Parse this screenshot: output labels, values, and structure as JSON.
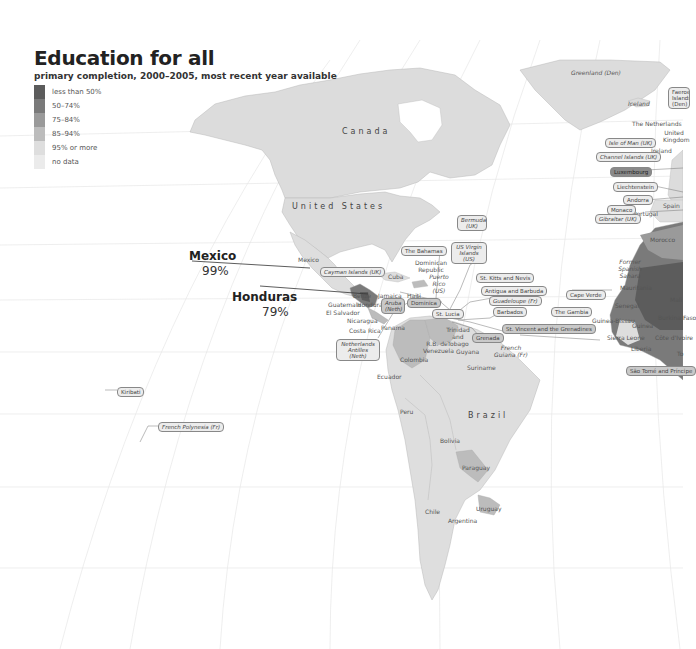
{
  "header": {
    "title": "Education for all",
    "subtitle": "primary completion, 2000–2005, most recent year available"
  },
  "legend": {
    "items": [
      {
        "label": "less than 50%",
        "color": "#5c5c5c"
      },
      {
        "label": "50–74%",
        "color": "#7a7a7a"
      },
      {
        "label": "75–84%",
        "color": "#9a9a9a"
      },
      {
        "label": "85–94%",
        "color": "#bcbcbc"
      },
      {
        "label": "95% or more",
        "color": "#dedede"
      },
      {
        "label": "no data",
        "color": "#ebebeb"
      }
    ]
  },
  "callouts": {
    "mexico": {
      "name": "Mexico",
      "value": "99%"
    },
    "honduras": {
      "name": "Honduras",
      "value": "79%"
    }
  },
  "regions": {
    "canada": "Canada",
    "united_states": "United States",
    "brazil": "Brazil",
    "greenland": "Greenland (Den)",
    "iceland": "Iceland",
    "mexico": "Mexico",
    "cuba": "Cuba",
    "jamaica": "Jamaica",
    "haiti": "Haiti",
    "dominican_republic": "Dominican Republic",
    "puerto_rico": "Puerto Rico (US)",
    "belize": "Belize",
    "guatemala": "Guatemala",
    "honduras": "Honduras",
    "el_salvador": "El Salvador",
    "nicaragua": "Nicaragua",
    "costa_rica": "Costa Rica",
    "panama": "Panama",
    "colombia": "Colombia",
    "venezuela": "R.B. de Venezuela",
    "trinidad": "Trinidad and Tobago",
    "guyana": "Guyana",
    "suriname": "Suriname",
    "french_guiana": "French Guiana (Fr)",
    "ecuador": "Ecuador",
    "peru": "Peru",
    "bolivia": "Bolivia",
    "paraguay": "Paraguay",
    "uruguay": "Uruguay",
    "chile": "Chile",
    "argentina": "Argentina",
    "the_netherlands": "The Netherlands",
    "united_kingdom": "United Kingdom",
    "ireland": "Ireland",
    "spain": "Spain",
    "portugal": "Portugal",
    "morocco": "Morocco",
    "western_sahara": "Former Spanish Sahara",
    "mauritania": "Mauritania",
    "mali": "Mali",
    "senegal": "Senegal",
    "guinea_bissau": "Guinea-Bissau",
    "guinea": "Guinea",
    "sierra_leone": "Sierra Leone",
    "liberia": "Liberia",
    "burkina_faso": "Burkina Faso",
    "cote_divoire": "Côte d'Ivoire",
    "togo": "To"
  },
  "tags": {
    "faeroe": "Faeroe Islands (Den)",
    "isle_of_man": "Isle of Man (UK)",
    "channel_islands": "Channel Islands (UK)",
    "luxembourg": "Luxembourg",
    "liechtenstein": "Liechtenstein",
    "andorra": "Andorra",
    "monaco": "Monaco",
    "gibraltar": "Gibraltar (UK)",
    "bermuda": "Bermuda (UK)",
    "us_virgin_islands": "US Virgin Islands (US)",
    "bahamas": "The Bahamas",
    "cayman": "Cayman Islands (UK)",
    "aruba": "Aruba (Neth)",
    "dominica": "Dominica",
    "st_lucia": "St. Lucia",
    "st_kitts": "St. Kitts and Nevis",
    "antigua": "Antigua and Barbuda",
    "guadeloupe": "Guadeloupe (Fr)",
    "barbados": "Barbados",
    "st_vincent": "St. Vincent and the Grenadines",
    "grenada": "Grenada",
    "neth_antilles": "Netherlands Antilles (Neth)",
    "cape_verde": "Cape Verde",
    "gambia": "The Gambia",
    "sao_tome": "São Tomé and Príncipe",
    "kiribati": "Kiribati",
    "french_polynesia": "French Polynesia (Fr)"
  }
}
